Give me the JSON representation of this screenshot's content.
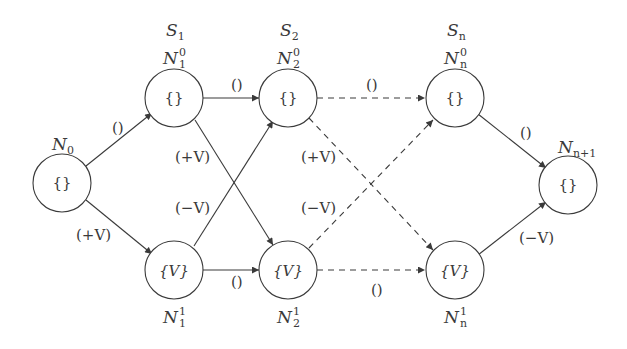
{
  "diagram": {
    "colors": {
      "stroke": "#3a3a3a",
      "background": "#ffffff"
    },
    "stages": [
      {
        "id": "S1",
        "label": "S",
        "sub": "1"
      },
      {
        "id": "S2",
        "label": "S",
        "sub": "2"
      },
      {
        "id": "Sn",
        "label": "S",
        "sub": "n"
      }
    ],
    "nodes": [
      {
        "id": "N0",
        "name": "N",
        "sub": "0",
        "sup": "",
        "content": "{}"
      },
      {
        "id": "N1_0",
        "name": "N",
        "sub": "1",
        "sup": "0",
        "content": "{}"
      },
      {
        "id": "N2_0",
        "name": "N",
        "sub": "2",
        "sup": "0",
        "content": "{}"
      },
      {
        "id": "Nn_0",
        "name": "N",
        "sub": "n",
        "sup": "0",
        "content": "{}"
      },
      {
        "id": "N1_1",
        "name": "N",
        "sub": "1",
        "sup": "1",
        "content": "{V}"
      },
      {
        "id": "N2_1",
        "name": "N",
        "sub": "2",
        "sup": "1",
        "content": "{V}"
      },
      {
        "id": "Nn_1",
        "name": "N",
        "sub": "n",
        "sup": "1",
        "content": "{V}"
      },
      {
        "id": "Nn1",
        "name": "N",
        "sub": "n+1",
        "sup": "",
        "content": "{}"
      }
    ],
    "edges": [
      {
        "from": "N0",
        "to": "N1_0",
        "label": "()",
        "style": "solid"
      },
      {
        "from": "N0",
        "to": "N1_1",
        "label": "(+V)",
        "style": "solid"
      },
      {
        "from": "N1_0",
        "to": "N2_0",
        "label": "()",
        "style": "solid"
      },
      {
        "from": "N1_0",
        "to": "N2_1",
        "label": "(+V)",
        "style": "solid"
      },
      {
        "from": "N1_1",
        "to": "N2_0",
        "label": "(−V)",
        "style": "solid"
      },
      {
        "from": "N1_1",
        "to": "N2_1",
        "label": "()",
        "style": "solid"
      },
      {
        "from": "N2_0",
        "to": "Nn_0",
        "label": "()",
        "style": "dashed"
      },
      {
        "from": "N2_0",
        "to": "Nn_1",
        "label": "(+V)",
        "style": "dashed"
      },
      {
        "from": "N2_1",
        "to": "Nn_0",
        "label": "(−V)",
        "style": "dashed"
      },
      {
        "from": "N2_1",
        "to": "Nn_1",
        "label": "()",
        "style": "dashed"
      },
      {
        "from": "Nn_0",
        "to": "Nn1",
        "label": "()",
        "style": "solid"
      },
      {
        "from": "Nn_1",
        "to": "Nn1",
        "label": "(−V)",
        "style": "solid"
      }
    ]
  }
}
